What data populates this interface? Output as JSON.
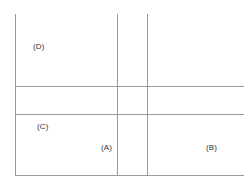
{
  "canvas": {
    "width": 250,
    "height": 186,
    "background_color": "#ffffff",
    "line_color": "#9a9a9a",
    "text_color": "#333333"
  },
  "diagram": {
    "title": "",
    "type": "line-partition-diagram",
    "labels": [
      {
        "id": "D",
        "text": "(D)",
        "x": 33,
        "y": 42
      },
      {
        "id": "C",
        "text": "(C)",
        "x": 37,
        "y": 122
      },
      {
        "id": "A",
        "text": "(A)",
        "x": 101,
        "y": 143
      },
      {
        "id": "B",
        "text": "(B)",
        "x": 206,
        "y": 143
      }
    ],
    "lines": [
      {
        "id": "vline-left",
        "orientation": "vertical",
        "x": 15,
        "y1": 14,
        "y2": 176
      },
      {
        "id": "vline-mid-a",
        "orientation": "vertical",
        "x": 117,
        "y1": 14,
        "y2": 176
      },
      {
        "id": "vline-mid-b",
        "orientation": "vertical",
        "x": 147,
        "y1": 14,
        "y2": 176
      },
      {
        "id": "hline-upper",
        "orientation": "horizontal",
        "y": 86,
        "x1": 15,
        "x2": 244
      },
      {
        "id": "hline-middle",
        "orientation": "horizontal",
        "y": 114,
        "x1": 15,
        "x2": 244
      },
      {
        "id": "hline-bottom",
        "orientation": "horizontal",
        "y": 175,
        "x1": 15,
        "x2": 244
      }
    ]
  }
}
